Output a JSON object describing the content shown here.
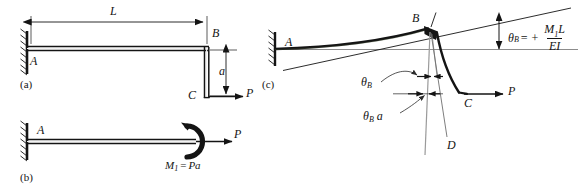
{
  "figure": {
    "background": "#ffffff",
    "ink": "#141414",
    "thin_ink": "#6e6e6e"
  },
  "panels": [
    {
      "id": "a",
      "label": "(a)",
      "caption": "L-shaped cantilever frame with vertical leg and horizontal load P"
    },
    {
      "id": "b",
      "label": "(b)",
      "caption": "Equivalent straight cantilever with end moment and axial load"
    },
    {
      "id": "c",
      "label": "(c)",
      "caption": "Deflected shape showing rotation of joint B"
    }
  ],
  "panel_a": {
    "labels": {
      "support_point": "A",
      "corner_point": "B",
      "free_end": "C",
      "span_dimension": "L",
      "leg_dimension": "a",
      "load": "P"
    },
    "notes": {
      "support": "fixed-wall-hatching",
      "load_direction": "rightward horizontal at C"
    }
  },
  "panel_b": {
    "labels": {
      "support_point": "A",
      "load": "P",
      "moment": {
        "symbol": "M",
        "subscript": "1",
        "equals": "=",
        "value": "Pa",
        "full": "M1 = Pa"
      }
    },
    "notes": {
      "support": "fixed-wall-hatching",
      "moment_direction": "counterclockwise curved arrow at free end"
    }
  },
  "panel_c": {
    "labels": {
      "support_point": "A",
      "joint_point": "B",
      "free_end": "C",
      "projected_point": "D",
      "load": "P",
      "rotation_small": "θ",
      "rotation_sub": "B",
      "offset_label": {
        "symbol": "θ",
        "subscript": "B",
        "times": "a",
        "full": "θB a"
      }
    },
    "equation": {
      "lhs_symbol": "θ",
      "lhs_sub": "B",
      "equals": "=",
      "sign": "+",
      "numerator_symbol": "M",
      "numerator_sub": "1",
      "numerator_rest": "L",
      "denominator": "EI",
      "full": "θB = + M1L / EI"
    },
    "notes": {
      "support": "fixed-wall-hatching",
      "rotation_measure": "vertical double-headed arrow between tangent line and horizontal reference",
      "deflected_curve": "thick curved beam rising from A to B then bending down to C"
    }
  }
}
